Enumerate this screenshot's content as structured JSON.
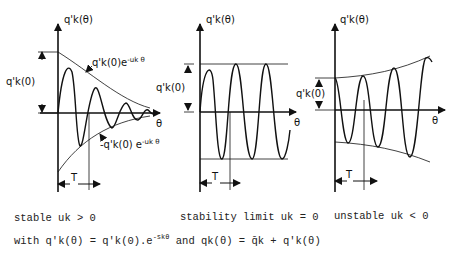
{
  "panels": [
    {
      "name": "stable",
      "y_axis_label": "q'k(θ)",
      "x_axis_label": "θ",
      "amplitude_label": "q'k(0)",
      "upper_envelope_label": "q'k(0)e",
      "upper_envelope_exp": "-uk θ",
      "lower_envelope_label": "-q'k(0) e",
      "lower_envelope_exp": "-uk θ",
      "period_label": "T",
      "caption": "stable  uk > 0"
    },
    {
      "name": "stability-limit",
      "y_axis_label": "q'k(θ)",
      "x_axis_label": "θ",
      "amplitude_label": "q'k(0)",
      "period_label": "T",
      "caption": "stability limit uk = 0"
    },
    {
      "name": "unstable",
      "y_axis_label": "q'k(θ)",
      "x_axis_label": "θ",
      "amplitude_label": "q'k(0)",
      "period_label": "T",
      "caption": "unstable uk < 0"
    }
  ],
  "formula": {
    "prefix": "with",
    "lhs1": "q'k(θ) = q'k(0).e",
    "exp1": "-skθ",
    "connector": "and",
    "lhs2": "qk(θ) = q̄k + q'k(θ)"
  }
}
